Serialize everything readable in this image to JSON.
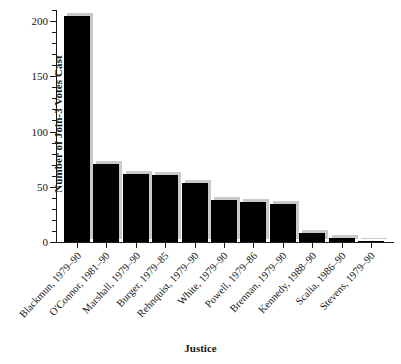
{
  "chart_data": {
    "type": "bar",
    "title": "",
    "xlabel": "Justice",
    "ylabel": "Number of Join-3 Votes Cast",
    "categories": [
      "Blackmun, 1979–90",
      "O'Connor, 1981–90",
      "Marshall, 1979–90",
      "Burger, 1979–85",
      "Rehnquist, 1979–90",
      "White, 1979–90",
      "Powell, 1979–86",
      "Brennan, 1979–90",
      "Kennedy, 1988–90",
      "Scalia, 1986–90",
      "Stevens, 1979–90"
    ],
    "values": [
      205,
      71,
      62,
      61,
      53,
      38,
      36,
      34,
      8,
      4,
      1
    ],
    "ylim": [
      0,
      210
    ],
    "yticks": [
      0,
      50,
      100,
      150,
      200
    ],
    "ytick_labels": [
      "0",
      "50",
      "100",
      "150",
      "200"
    ],
    "yminor_step": 10,
    "grid": false,
    "legend": null,
    "bar_color": "#000000",
    "shadow_color": "#c9c9c9",
    "axis_color": "#1a1a1a",
    "background": "#ffffff"
  }
}
